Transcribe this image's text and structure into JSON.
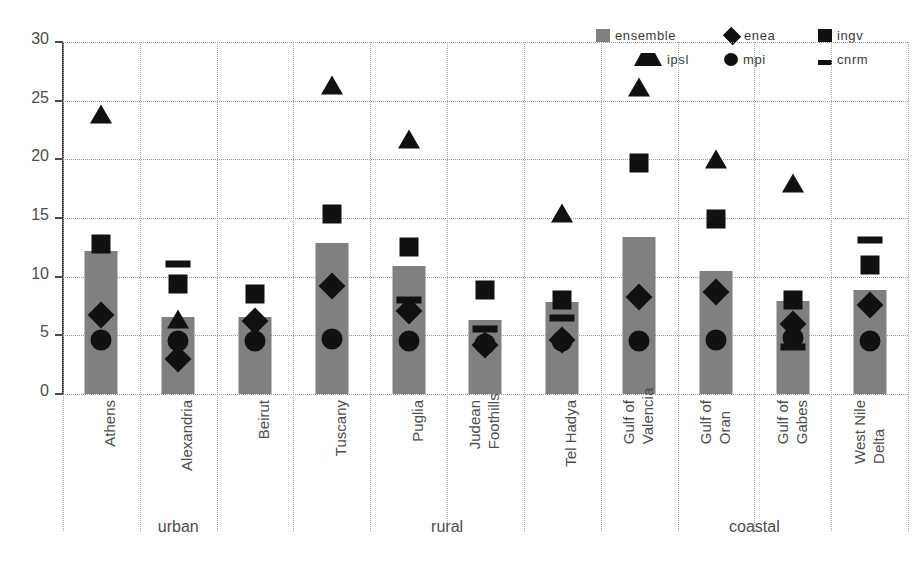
{
  "chart_data": {
    "type": "bar",
    "title": "",
    "subtitle": "",
    "xlabel": "",
    "ylabel": "",
    "ylim": [
      0,
      30
    ],
    "ytick_step": 5,
    "yticks": [
      "30",
      "25",
      "20",
      "15",
      "10",
      "5",
      "0"
    ],
    "grid": "horizontal-dotted-and-vertical-dotted",
    "legend_position": "top-right",
    "categories": [
      "Athens",
      "Alexandria",
      "Beirut",
      "Tuscany",
      "Puglia",
      "Judean Foothills",
      "Tel Hadya",
      "Gulf of Valencia",
      "Gulf of Oran",
      "Gulf of Gabes",
      "West Nile Delta"
    ],
    "category_lines": [
      [
        "Athens"
      ],
      [
        "Alexandria"
      ],
      [
        "Beirut"
      ],
      [
        "Tuscany"
      ],
      [
        "Puglia"
      ],
      [
        "Judean",
        "Foothills"
      ],
      [
        "Tel Hadya"
      ],
      [
        "Gulf of",
        "Valencia"
      ],
      [
        "Gulf of",
        "Oran"
      ],
      [
        "Gulf of",
        "Gabes"
      ],
      [
        "West Nile",
        "Delta"
      ]
    ],
    "groups": [
      {
        "label": "urban",
        "start": 0,
        "end": 2
      },
      {
        "label": "rural",
        "start": 3,
        "end": 6
      },
      {
        "label": "coastal",
        "start": 7,
        "end": 10
      }
    ],
    "series": [
      {
        "name": "ensemble",
        "marker": "bar",
        "color": "#808080",
        "values": [
          12.2,
          6.6,
          6.6,
          12.9,
          10.9,
          6.3,
          7.8,
          13.4,
          10.5,
          7.9,
          8.9
        ]
      },
      {
        "name": "enea",
        "marker": "diamond",
        "color": "#111111",
        "values": [
          6.7,
          3.0,
          6.2,
          9.2,
          7.1,
          4.2,
          4.6,
          8.3,
          8.7,
          6.0,
          7.6
        ]
      },
      {
        "name": "ingv",
        "marker": "square",
        "color": "#111111",
        "values": [
          12.8,
          9.4,
          8.5,
          15.3,
          12.5,
          8.9,
          8.0,
          19.7,
          14.9,
          8.0,
          11.0
        ]
      },
      {
        "name": "ipsl",
        "marker": "triangle",
        "color": "#111111",
        "values": [
          23.9,
          6.4,
          null,
          26.3,
          21.7,
          null,
          15.4,
          26.2,
          20.0,
          18.0,
          null
        ]
      },
      {
        "name": "mpi",
        "marker": "circle",
        "color": "#111111",
        "values": [
          4.6,
          4.5,
          4.5,
          4.7,
          4.5,
          4.3,
          4.5,
          4.5,
          4.6,
          4.8,
          4.5
        ]
      },
      {
        "name": "cnrm",
        "marker": "dash",
        "color": "#111111",
        "values": [
          null,
          11.1,
          null,
          null,
          8.0,
          5.5,
          6.5,
          null,
          null,
          4.0,
          13.1
        ]
      }
    ]
  },
  "legend": {
    "items": [
      {
        "label": "ensemble",
        "marker": "gray-square",
        "icon_name": "legend-swatch-ensemble"
      },
      {
        "label": "enea",
        "marker": "diamond",
        "icon_name": "legend-swatch-enea"
      },
      {
        "label": "ingv",
        "marker": "square",
        "icon_name": "legend-swatch-ingv"
      },
      {
        "label": "ipsl",
        "marker": "triangle",
        "icon_name": "legend-swatch-ipsl"
      },
      {
        "label": "mpi",
        "marker": "circle",
        "icon_name": "legend-swatch-mpi"
      },
      {
        "label": "cnrm",
        "marker": "dash",
        "icon_name": "legend-swatch-cnrm"
      }
    ]
  },
  "colors": {
    "bar_gray": "#808080",
    "marker_black": "#111111",
    "axis": "#4a4a4a",
    "grid": "#9a9a9a",
    "text": "#4d4d4d",
    "background": "#ffffff"
  }
}
